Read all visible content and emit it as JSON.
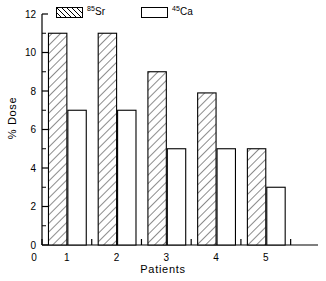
{
  "chart_data": {
    "type": "bar",
    "title": "",
    "xlabel": "Patients",
    "ylabel": "% Dose",
    "categories": [
      "1",
      "2",
      "3",
      "4",
      "5"
    ],
    "series": [
      {
        "name": "85Sr",
        "name_mass": "85",
        "name_element": "Sr",
        "fill": "hatched",
        "values": [
          11,
          11,
          9,
          7.9,
          5
        ]
      },
      {
        "name": "45Ca",
        "name_mass": "45",
        "name_element": "Ca",
        "fill": "empty",
        "values": [
          7,
          7,
          5,
          5,
          3
        ]
      }
    ],
    "ylim": [
      0,
      12
    ],
    "y_major_ticks": [
      0,
      2,
      4,
      6,
      8,
      10,
      12
    ],
    "y_major_tick_labels": [
      "0",
      "2",
      "4",
      "6",
      "8",
      "10",
      "12"
    ],
    "y_minor_ticks": [
      1,
      3,
      5,
      7,
      9,
      11
    ],
    "x_tick_labels": [
      "0",
      "1",
      "2",
      "3",
      "4",
      "5"
    ],
    "grid": false,
    "legend_position": "top",
    "line_color": "#000000",
    "background_color": "#ffffff"
  },
  "legend": {
    "entries": [
      {
        "mass": "85",
        "element": "Sr"
      },
      {
        "mass": "45",
        "element": "Ca"
      }
    ]
  },
  "axes": {
    "y_title": "% Dose",
    "x_title": "Patients",
    "y_labels": [
      "12",
      "10",
      "8",
      "6",
      "4",
      "2",
      "0"
    ],
    "x_labels": [
      "0",
      "1",
      "2",
      "3",
      "4",
      "5"
    ]
  }
}
